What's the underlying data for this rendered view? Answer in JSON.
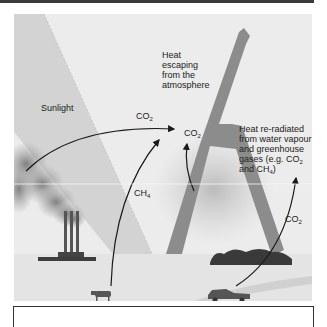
{
  "figure": {
    "labels": {
      "sunlight": "Sunlight",
      "heat_escaping": [
        "Heat",
        "escaping",
        "from the",
        "atmosphere"
      ],
      "heat_reradiated": [
        "Heat re-radiated",
        "from water vapour",
        "and greenhouse",
        "gases (e.g. CO",
        "and CH"
      ],
      "co2_factory": "CO",
      "co2_center": "CO",
      "ch4_cow": "CH",
      "co2_car": "CO",
      "sub_2": "2",
      "sub_4": "4"
    },
    "sources": [
      "factory",
      "cow",
      "car",
      "vegetation"
    ],
    "colors": {
      "sky": "#ececec",
      "sunlight_beam": "#d6d6d6",
      "heat_beam": "#8a8a8a",
      "smoke": "#8c8c8c",
      "arrow": "#1a1a1a",
      "ground": "#e2e2e2",
      "border": "#3a3a3a"
    }
  }
}
